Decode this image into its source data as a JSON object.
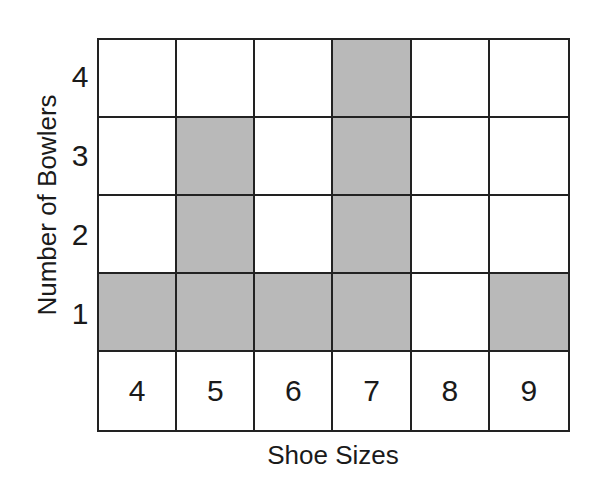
{
  "chart_data": {
    "type": "bar",
    "style": "shaded grid bar graph",
    "title": "",
    "xlabel": "Shoe Sizes",
    "ylabel": "Number of Bowlers",
    "categories": [
      "4",
      "5",
      "6",
      "7",
      "8",
      "9"
    ],
    "values": [
      1,
      3,
      1,
      4,
      0,
      1
    ],
    "y_ticks": [
      "1",
      "2",
      "3",
      "4"
    ],
    "ylim": [
      0,
      4
    ],
    "grid": true,
    "legend": null,
    "fill_color": "#b9b9b9"
  },
  "labels": {
    "x_axis": "Shoe Sizes",
    "y_axis": "Number of Bowlers",
    "y_ticks": [
      "4",
      "3",
      "2",
      "1"
    ],
    "categories": [
      "4",
      "5",
      "6",
      "7",
      "8",
      "9"
    ]
  }
}
